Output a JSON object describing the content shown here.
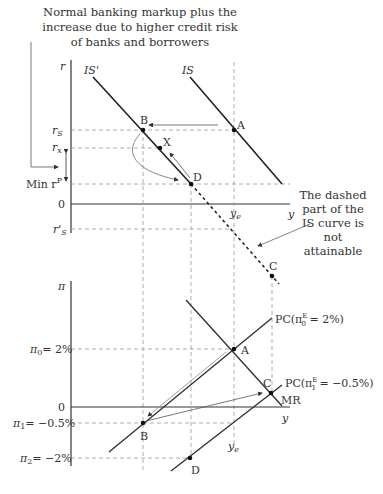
{
  "annotations": {
    "top_note": [
      "Normal banking markup plus the",
      "increase due to higher credit risk",
      "of banks and borrowers"
    ],
    "dashed_note": [
      "The dashed",
      "part of the",
      "IS curve is",
      "not",
      "attainable"
    ]
  },
  "top_panel": {
    "y_axis_label": "r",
    "x_axis_label": "y",
    "curves": {
      "is_prime": "IS'",
      "is": "IS"
    },
    "y_ticks": {
      "rs": "r",
      "rs_sub": "S",
      "rx": "r",
      "rx_sub": "x",
      "min_rp": "Min r",
      "min_rp_sup": "P",
      "zero": "0",
      "rs_prime": "r'",
      "rs_prime_sub": "S"
    },
    "x_ticks": {
      "ye": "y",
      "ye_sub": "e"
    },
    "points": {
      "A": "A",
      "B": "B",
      "X": "X",
      "D": "D",
      "C": "C"
    }
  },
  "bottom_panel": {
    "y_axis_label": "π",
    "x_axis_label": "y",
    "y_ticks": {
      "pi0": "π",
      "pi0_sub": "0",
      "pi0_val": "= 2%",
      "zero": "0",
      "pi1": "π",
      "pi1_sub": "1",
      "pi1_val": "= −0.5%",
      "pi2": "π",
      "pi2_sub": "2",
      "pi2_val": "= −2%"
    },
    "x_ticks": {
      "ye": "y",
      "ye_sub": "e"
    },
    "curves": {
      "pc0_pre": "PC(π",
      "pc0_sup": "E",
      "pc0_sub": "0",
      "pc0_post": " = 2%)",
      "pc1_pre": "PC(π",
      "pc1_sup": "E",
      "pc1_sub": "1",
      "pc1_post": " = −0.5%)",
      "mr": "MR"
    },
    "points": {
      "A": "A",
      "B": "B",
      "C": "C",
      "D": "D"
    }
  },
  "colors": {
    "line": "#333333",
    "dash": "#999999",
    "thin": "#777777"
  }
}
